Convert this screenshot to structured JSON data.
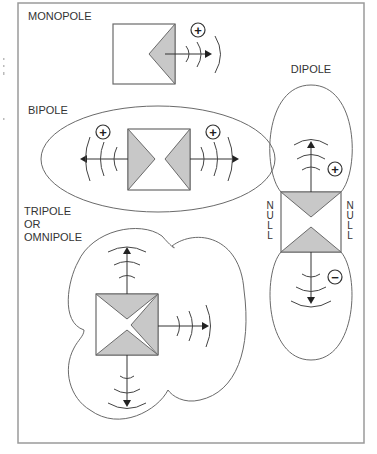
{
  "diagram": {
    "labels": {
      "monopole": "MONOPOLE",
      "bipole": "BIPOLE",
      "dipole": "DIPOLE",
      "tripole_line1": "TRIPOLE",
      "tripole_line2": "OR",
      "tripole_line3": "OMNIPOLE"
    },
    "polarity": {
      "monopole": "+",
      "bipole_left": "+",
      "bipole_right": "+",
      "dipole_top": "+",
      "dipole_bottom": "−"
    },
    "null_labels": {
      "left": [
        "N",
        "U",
        "L",
        "L"
      ],
      "right": [
        "N",
        "U",
        "L",
        "L"
      ]
    },
    "colors": {
      "driver_fill": "#c8c8c8",
      "stroke": "#6a6a6a",
      "frame": "#9a9a9a"
    }
  }
}
